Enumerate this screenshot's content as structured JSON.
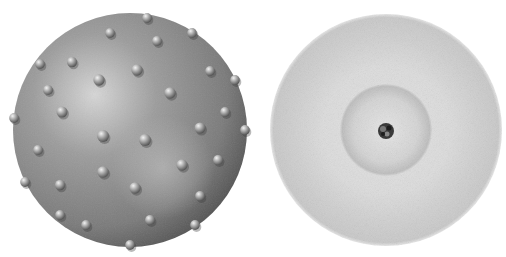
{
  "figure": {
    "panels": [
      {
        "id": "left",
        "description": "Solid shaded sphere studded with small embedded spherical bumps",
        "sphere": {
          "cx": 130,
          "cy": 130,
          "r": 117,
          "base_color": "#8a8a8a",
          "highlight": "#d8d8d8",
          "shadow": "#3c3c3c"
        },
        "bumps": [
          [
            147,
            18
          ],
          [
            110,
            33
          ],
          [
            157,
            41
          ],
          [
            192,
            33
          ],
          [
            72,
            62
          ],
          [
            137,
            70
          ],
          [
            40,
            64
          ],
          [
            99,
            80
          ],
          [
            210,
            71
          ],
          [
            48,
            90
          ],
          [
            170,
            93
          ],
          [
            235,
            80
          ],
          [
            62,
            112
          ],
          [
            103,
            136
          ],
          [
            145,
            140
          ],
          [
            200,
            128
          ],
          [
            225,
            112
          ],
          [
            14,
            118
          ],
          [
            245,
            130
          ],
          [
            38,
            150
          ],
          [
            60,
            185
          ],
          [
            103,
            172
          ],
          [
            182,
            165
          ],
          [
            218,
            160
          ],
          [
            135,
            188
          ],
          [
            25,
            182
          ],
          [
            200,
            196
          ],
          [
            150,
            220
          ],
          [
            86,
            225
          ],
          [
            130,
            245
          ],
          [
            195,
            225
          ],
          [
            60,
            215
          ]
        ]
      },
      {
        "id": "right",
        "description": "Diffuse stippled electron-cloud disc with a denser inner shell and a tiny dark nucleus at center",
        "cloud": {
          "cx": 133,
          "cy": 130,
          "r": 116,
          "outer_color": "#c4c4c4",
          "mid_color": "#dcdcdc"
        },
        "inner_shell": {
          "r": 46,
          "color": "#bdbdbd"
        },
        "nucleus": {
          "r": 8,
          "color": "#2a2a2a"
        }
      }
    ]
  }
}
